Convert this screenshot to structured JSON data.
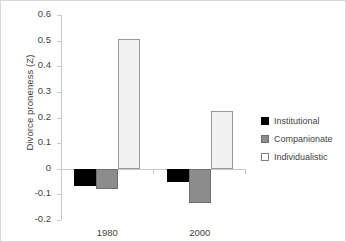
{
  "chart_data": {
    "type": "bar",
    "title": "",
    "xlabel": "",
    "ylabel": "Divorce proneness (Z)",
    "categories": [
      "1980",
      "2000"
    ],
    "series": [
      {
        "name": "Institutional",
        "values": [
          -0.067,
          -0.05
        ],
        "color": "#000000"
      },
      {
        "name": "Companionate",
        "values": [
          -0.08,
          -0.135
        ],
        "color": "#8c8c8c"
      },
      {
        "name": "Individualistic",
        "values": [
          0.505,
          0.227
        ],
        "color": "#f1f1f1"
      }
    ],
    "ylim": [
      -0.2,
      0.6
    ],
    "ytick_labels": [
      "0.6",
      "0.5",
      "0.4",
      "0.3",
      "0.2",
      "0.1",
      "0",
      "-0.1",
      "-0.2"
    ],
    "ytick_values": [
      0.6,
      0.5,
      0.4,
      0.3,
      0.2,
      0.1,
      0,
      -0.1,
      -0.2
    ],
    "grid": false,
    "legend_position": "right"
  },
  "legend": {
    "items": [
      {
        "label": "Institutional"
      },
      {
        "label": "Companionate"
      },
      {
        "label": "Individualistic"
      }
    ]
  }
}
